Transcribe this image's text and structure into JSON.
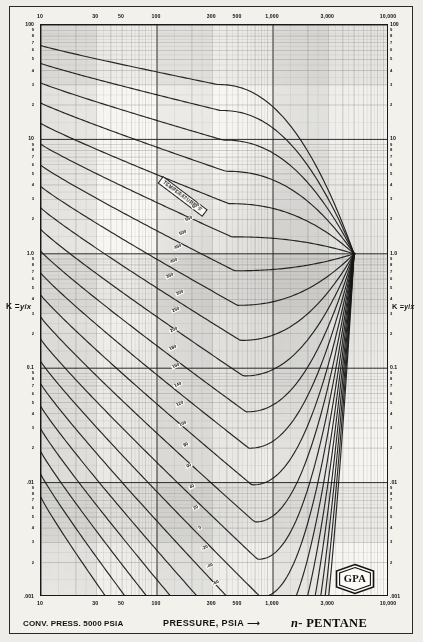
{
  "chart_data": {
    "type": "line",
    "subtitle": "K-value vs Pressure (DePriester / GPA chart)",
    "xlabel": "PRESSURE, PSIA",
    "ylabel": "K = y/x",
    "xscale": "log",
    "yscale": "log",
    "xlim": [
      10,
      10000
    ],
    "ylim": [
      0.001,
      100
    ],
    "grid": "log-log minor grid on",
    "legend": "inline curve labels",
    "convergence_pressure_psia": 5000,
    "x_ticks_labeled": [
      "10",
      "30",
      "50",
      "100",
      "300",
      "500",
      "1,000",
      "3,000",
      "10,000"
    ],
    "y_ticks_labeled": [
      "100",
      "10",
      "1.0",
      "0.1",
      ".01",
      ".001"
    ],
    "y_minor_ticks": [
      "9",
      "8",
      "7",
      "6",
      "5",
      "4",
      "3",
      "2"
    ],
    "series_label": "TEMPERATURE °F",
    "series": [
      {
        "name": "600",
        "values": [],
        "note": "highest isotherm, nearly flat near K=1"
      },
      {
        "name": "550",
        "values": []
      },
      {
        "name": "500",
        "values": []
      },
      {
        "name": "450",
        "values": []
      },
      {
        "name": "400",
        "values": []
      },
      {
        "name": "350",
        "values": []
      },
      {
        "name": "300",
        "values": []
      },
      {
        "name": "250",
        "values": []
      },
      {
        "name": "200",
        "values": []
      },
      {
        "name": "180",
        "values": []
      },
      {
        "name": "160",
        "values": []
      },
      {
        "name": "140",
        "values": []
      },
      {
        "name": "120",
        "values": []
      },
      {
        "name": "100",
        "values": []
      },
      {
        "name": "80",
        "values": []
      },
      {
        "name": "60",
        "values": []
      },
      {
        "name": "40",
        "values": []
      },
      {
        "name": "20",
        "values": []
      },
      {
        "name": "0",
        "values": []
      },
      {
        "name": "-20",
        "values": []
      },
      {
        "name": "-40",
        "values": []
      },
      {
        "name": "-60",
        "values": []
      }
    ]
  },
  "axes": {
    "x_top_labels": [
      {
        "text": "10",
        "v": 10
      },
      {
        "text": "30",
        "v": 30
      },
      {
        "text": "50",
        "v": 50
      },
      {
        "text": "100",
        "v": 100
      },
      {
        "text": "300",
        "v": 300
      },
      {
        "text": "500",
        "v": 500
      },
      {
        "text": "1,000",
        "v": 1000
      },
      {
        "text": "3,000",
        "v": 3000
      },
      {
        "text": "10,000",
        "v": 10000
      }
    ],
    "x_bottom_labels": [
      {
        "text": "10",
        "v": 10
      },
      {
        "text": "30",
        "v": 30
      },
      {
        "text": "50",
        "v": 50
      },
      {
        "text": "100",
        "v": 100
      },
      {
        "text": "300",
        "v": 300
      },
      {
        "text": "500",
        "v": 500
      },
      {
        "text": "1,000",
        "v": 1000
      },
      {
        "text": "3,000",
        "v": 3000
      },
      {
        "text": "10,000",
        "v": 10000
      }
    ],
    "y_decade_labels": [
      {
        "text": "100",
        "v": 100
      },
      {
        "text": "10",
        "v": 10
      },
      {
        "text": "1.0",
        "v": 1
      },
      {
        "text": "0.1",
        "v": 0.1
      },
      {
        "text": ".01",
        "v": 0.01
      },
      {
        "text": ".001",
        "v": 0.001
      }
    ],
    "y_decade_labels_right": [
      {
        "text": "100",
        "v": 100
      },
      {
        "text": "10",
        "v": 10
      },
      {
        "text": "1.0",
        "v": 1
      },
      {
        "text": "0.1",
        "v": 0.1
      },
      {
        "text": ".01",
        "v": 0.01
      },
      {
        "text": ".001",
        "v": 0.001
      }
    ],
    "y_minor_digits": [
      "9",
      "8",
      "7",
      "6",
      "5",
      "4",
      "3",
      "2"
    ],
    "k_label_left": "K =",
    "k_label_numerator": "y",
    "k_label_denominator": "x",
    "k_label_right": "K ="
  },
  "curves": {
    "band_label": "TEMPERATURE °F",
    "labels": [
      {
        "t": "600",
        "x": 196,
        "y": 206
      },
      {
        "t": "550",
        "x": 189,
        "y": 219
      },
      {
        "t": "500",
        "x": 183,
        "y": 233
      },
      {
        "t": "450",
        "x": 178,
        "y": 247
      },
      {
        "t": "400",
        "x": 174,
        "y": 261
      },
      {
        "t": "350",
        "x": 170,
        "y": 276
      },
      {
        "t": "300",
        "x": 180,
        "y": 293
      },
      {
        "t": "250",
        "x": 176,
        "y": 310
      },
      {
        "t": "200",
        "x": 174,
        "y": 330
      },
      {
        "t": "180",
        "x": 173,
        "y": 348
      },
      {
        "t": "160",
        "x": 176,
        "y": 366
      },
      {
        "t": "140",
        "x": 178,
        "y": 385
      },
      {
        "t": "120",
        "x": 180,
        "y": 404
      },
      {
        "t": "100",
        "x": 183,
        "y": 424
      },
      {
        "t": "80",
        "x": 186,
        "y": 445
      },
      {
        "t": "60",
        "x": 189,
        "y": 466
      },
      {
        "t": "40",
        "x": 192,
        "y": 487
      },
      {
        "t": "20",
        "x": 196,
        "y": 508
      },
      {
        "t": "0",
        "x": 200,
        "y": 528
      },
      {
        "t": "-20",
        "x": 205,
        "y": 548
      },
      {
        "t": "-40",
        "x": 210,
        "y": 566
      },
      {
        "t": "-60",
        "x": 216,
        "y": 583
      }
    ]
  },
  "footer": {
    "conv_press": "CONV. PRESS. 5000 PSIA",
    "pressure_title": "PRESSURE, PSIA",
    "arrow": "⟶",
    "compound_prefix": "n",
    "compound": "- PENTANE",
    "logo_text": "GPA"
  },
  "colors": {
    "ink": "#141414",
    "grid_major": "#2a2a2a",
    "grid_minor": "#8d8b86",
    "paper": "#f3f1ec",
    "curve": "#1b1b1b"
  }
}
